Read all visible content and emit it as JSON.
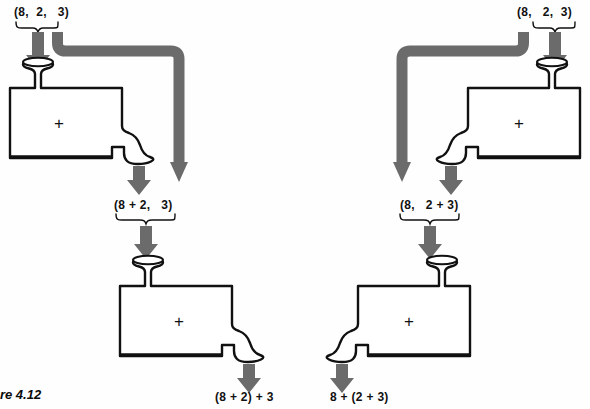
{
  "figure": {
    "caption": "ure 4.12",
    "caption_full": "Figure 4.12",
    "background_color": "#ffffff",
    "arrow_color": "#6b6b6b",
    "pipe_color": "#6b6b6b",
    "outline_color": "#111111",
    "vessel_fill": "#ffffff"
  },
  "machines": {
    "top_left": {
      "operator": "+",
      "name": "adder-machine-top-left",
      "input_label": "(8,  2,   3)",
      "output_label": "(8 + 2,   3)"
    },
    "top_right": {
      "operator": "+",
      "name": "adder-machine-top-right",
      "input_label": "(8,   2,  3)",
      "output_label": "(8,   2 + 3)"
    },
    "bottom_left": {
      "operator": "+",
      "name": "adder-machine-bottom-left",
      "input_label": "(8 + 2,   3)",
      "output_label": "(8 + 2) + 3"
    },
    "bottom_right": {
      "operator": "+",
      "name": "adder-machine-bottom-right",
      "input_label": "(8,   2 + 3)",
      "output_label": "8 + (2 + 3)"
    }
  },
  "labels": {
    "top_left_input": "(8,  2,   3)",
    "top_right_input": "(8,   2,  3)",
    "mid_left": "(8 + 2,   3)",
    "mid_right": "(8,   2 + 3)",
    "bottom_left_output": "(8 + 2) + 3",
    "bottom_right_output": "8 + (2 + 3)",
    "operator_plus": "+"
  },
  "icons": {
    "down_arrow": "down-arrow-icon",
    "brace": "brace-icon",
    "bypass_pipe": "bypass-pipe-icon",
    "funnel": "funnel-icon",
    "spout": "spout-icon"
  }
}
